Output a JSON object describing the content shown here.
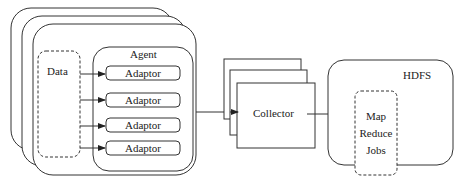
{
  "diagram": {
    "agent_stack": {
      "label": "Agent",
      "data_label": "Data",
      "adaptors": [
        "Adaptor",
        "Adaptor",
        "Adaptor",
        "Adaptor"
      ]
    },
    "collector": {
      "label": "Collector"
    },
    "hdfs": {
      "label": "HDFS",
      "jobs_lines": [
        "Map",
        "Reduce",
        "Jobs"
      ]
    },
    "colors": {
      "stroke": "#333333",
      "background": "#ffffff",
      "text": "#222222"
    }
  }
}
